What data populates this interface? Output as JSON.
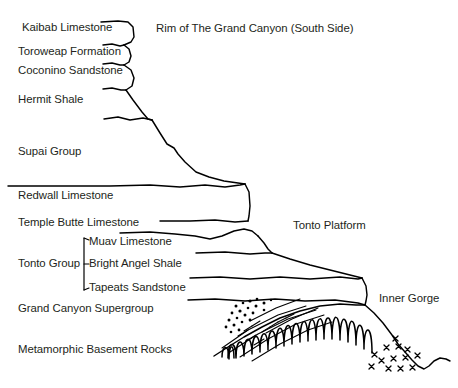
{
  "figure": {
    "background_color": "#ffffff",
    "line_color": "#000000",
    "text_color": "#231f20"
  },
  "annotations": {
    "rim": "Rim of The Grand Canyon (South Side)",
    "tonto_platform": "Tonto Platform",
    "inner_gorge": "Inner Gorge"
  },
  "strata": [
    {
      "id": "kaibab",
      "label": "Kaibab Limestone"
    },
    {
      "id": "toroweap",
      "label": "Toroweap Formation"
    },
    {
      "id": "coconino",
      "label": "Coconino Sandstone"
    },
    {
      "id": "hermit",
      "label": "Hermit Shale"
    },
    {
      "id": "supai",
      "label": "Supai Group"
    },
    {
      "id": "redwall",
      "label": "Redwall Limestone"
    },
    {
      "id": "temple",
      "label": "Temple Butte Limestone"
    },
    {
      "id": "supergroup",
      "label": "Grand Canyon Supergroup"
    },
    {
      "id": "basement",
      "label": "Metamorphic Basement Rocks"
    }
  ],
  "tonto_group": {
    "label": "Tonto Group",
    "members": [
      {
        "id": "muav",
        "label": "Muav Limestone"
      },
      {
        "id": "bright",
        "label": "Bright Angel Shale"
      },
      {
        "id": "tapeats",
        "label": "Tapeats Sandstone"
      }
    ]
  }
}
